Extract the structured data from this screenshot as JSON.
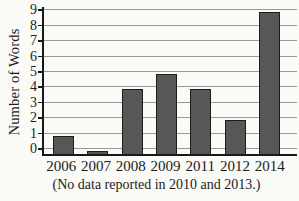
{
  "chart_data": {
    "type": "bar",
    "title": "",
    "xlabel": "",
    "ylabel": "Number of Words",
    "categories": [
      "2006",
      "2007",
      "2008",
      "2009",
      "2011",
      "2012",
      "2014"
    ],
    "values": [
      1,
      0,
      4,
      5,
      4,
      2,
      9
    ],
    "ylim": [
      0,
      9
    ],
    "yticks": [
      0,
      1,
      2,
      3,
      4,
      5,
      6,
      7,
      8,
      9
    ],
    "grid": "horizontal",
    "legend": "none",
    "caption": "(No data reported in 2010 and 2013.)",
    "bar_color": "#575757",
    "bar_border_color": "#1c1c1c",
    "gridline_color": "#9a9a9a",
    "axis_color": "#191919",
    "text_color": "#1c1c1c",
    "background_color": "#fafaf6"
  }
}
